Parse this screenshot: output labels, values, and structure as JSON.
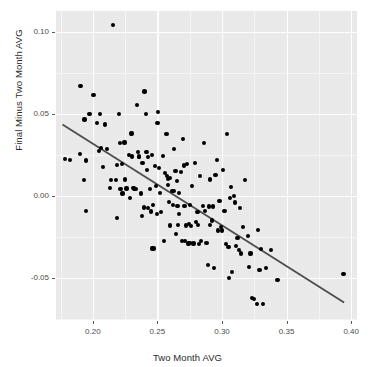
{
  "chart_data": {
    "type": "scatter",
    "title": "",
    "xlabel": "Two Month AVG",
    "ylabel": "Final Minus Two Month AVG",
    "xlim": [
      0.1715,
      0.4045
    ],
    "ylim": [
      -0.0755,
      0.1125
    ],
    "xticks": [
      0.2,
      0.25,
      0.3,
      0.35,
      0.4
    ],
    "xtick_labels": [
      "0.20",
      "0.25",
      "0.30",
      "0.35",
      "0.40"
    ],
    "yticks": [
      -0.05,
      0.0,
      0.05,
      0.1
    ],
    "ytick_labels": [
      "-0.05",
      "0.00",
      "0.05",
      "0.10"
    ],
    "x_minor_ticks": [
      0.175,
      0.225,
      0.275,
      0.325,
      0.375
    ],
    "y_minor_ticks": [
      -0.075,
      -0.025,
      0.025,
      0.075
    ],
    "grid": true,
    "legend": "none",
    "panel_background": "#ebebeb",
    "grid_major_color": "#ffffff",
    "grid_minor_color": "#f6f6f6",
    "point_color": "#000000",
    "point_size": 4.2,
    "fit_line": {
      "type": "linear",
      "color": "#4d4d4d",
      "width": 1.8,
      "x_start": 0.1765,
      "y_start": 0.0435,
      "x_end": 0.3945,
      "y_end": -0.0648
    },
    "points": [
      [
        0.1785,
        0.0225
      ],
      [
        0.1825,
        0.022
      ],
      [
        0.19,
        0.0255
      ],
      [
        0.1905,
        0.067
      ],
      [
        0.193,
        0.0095
      ],
      [
        0.1935,
        0.0465
      ],
      [
        0.1945,
        0.0215
      ],
      [
        0.195,
        -0.009
      ],
      [
        0.1975,
        0.05
      ],
      [
        0.2005,
        0.0615
      ],
      [
        0.203,
        0.0445
      ],
      [
        0.2045,
        0.0275
      ],
      [
        0.2055,
        0.05
      ],
      [
        0.2065,
        0.029
      ],
      [
        0.208,
        0.0175
      ],
      [
        0.2095,
        0.0435
      ],
      [
        0.211,
        0.0285
      ],
      [
        0.213,
        0.005
      ],
      [
        0.214,
        0.0095
      ],
      [
        0.2155,
        0.104
      ],
      [
        0.218,
        0.0095
      ],
      [
        0.2185,
        0.019
      ],
      [
        0.219,
        -0.0135
      ],
      [
        0.22,
        0.05
      ],
      [
        0.221,
        0.032
      ],
      [
        0.2215,
        0.004
      ],
      [
        0.2225,
        0.0195
      ],
      [
        0.223,
        0.0015
      ],
      [
        0.2245,
        0.0325
      ],
      [
        0.225,
        0.01
      ],
      [
        0.226,
        0.0045
      ],
      [
        0.228,
        0.025
      ],
      [
        0.2285,
        -0.0015
      ],
      [
        0.23,
        0.038
      ],
      [
        0.2305,
        0.024
      ],
      [
        0.231,
        0.005
      ],
      [
        0.232,
        0.0045
      ],
      [
        0.233,
        0.004
      ],
      [
        0.2345,
        0.0555
      ],
      [
        0.235,
        0.0265
      ],
      [
        0.2355,
        0.024
      ],
      [
        0.236,
        0.0235
      ],
      [
        0.237,
        0.0015
      ],
      [
        0.238,
        -0.012
      ],
      [
        0.2385,
        0.02
      ],
      [
        0.2395,
        -0.007
      ],
      [
        0.24,
        0.0635
      ],
      [
        0.241,
        0.05
      ],
      [
        0.2415,
        0.0265
      ],
      [
        0.242,
        0.016
      ],
      [
        0.2425,
        -0.0075
      ],
      [
        0.243,
        0.0235
      ],
      [
        0.244,
        0.004
      ],
      [
        0.245,
        -0.0095
      ],
      [
        0.2455,
        -0.032
      ],
      [
        0.246,
        0.025
      ],
      [
        0.2465,
        -0.0055
      ],
      [
        0.247,
        -0.032
      ],
      [
        0.248,
        0.018
      ],
      [
        0.249,
        0.006
      ],
      [
        0.2495,
        -0.011
      ],
      [
        0.25,
        0.0445
      ],
      [
        0.2505,
        0.051
      ],
      [
        0.251,
        0.017
      ],
      [
        0.252,
        0.002
      ],
      [
        0.253,
        -0.01
      ],
      [
        0.2545,
        0.0245
      ],
      [
        0.255,
        -0.0275
      ],
      [
        0.256,
        0.014
      ],
      [
        0.257,
        0.0375
      ],
      [
        0.2575,
        0.012
      ],
      [
        0.258,
        0.0105
      ],
      [
        0.2585,
        0.0065
      ],
      [
        0.259,
        -0.0035
      ],
      [
        0.2595,
        -0.018
      ],
      [
        0.26,
        0.011
      ],
      [
        0.261,
        0.003
      ],
      [
        0.262,
        -0.0055
      ],
      [
        0.2625,
        0.003
      ],
      [
        0.263,
        0.0285
      ],
      [
        0.264,
        0.015
      ],
      [
        0.2645,
        -0.023
      ],
      [
        0.265,
        0.009
      ],
      [
        0.2655,
        -0.006
      ],
      [
        0.266,
        -0.0175
      ],
      [
        0.2665,
        0.002
      ],
      [
        0.267,
        -0.011
      ],
      [
        0.268,
        0.0145
      ],
      [
        0.269,
        -0.0275
      ],
      [
        0.27,
        0.0345
      ],
      [
        0.2705,
        0.0185
      ],
      [
        0.271,
        -0.006
      ],
      [
        0.2715,
        -0.0275
      ],
      [
        0.272,
        -0.018
      ],
      [
        0.273,
        0.0195
      ],
      [
        0.274,
        -0.029
      ],
      [
        0.2745,
        -0.017
      ],
      [
        0.275,
        -0.0055
      ],
      [
        0.2755,
        -0.0285
      ],
      [
        0.276,
        -0.0185
      ],
      [
        0.277,
        0.006
      ],
      [
        0.278,
        -0.029
      ],
      [
        0.279,
        0.02
      ],
      [
        0.28,
        -0.016
      ],
      [
        0.281,
        -0.01
      ],
      [
        0.2815,
        -0.0175
      ],
      [
        0.282,
        -0.0295
      ],
      [
        0.283,
        0.012
      ],
      [
        0.284,
        -0.0275
      ],
      [
        0.285,
        -0.006
      ],
      [
        0.286,
        0.032
      ],
      [
        0.287,
        -0.009
      ],
      [
        0.288,
        -0.0285
      ],
      [
        0.289,
        -0.042
      ],
      [
        0.29,
        -0.0065
      ],
      [
        0.2905,
        -0.0175
      ],
      [
        0.291,
        0.01
      ],
      [
        0.292,
        -0.015
      ],
      [
        0.293,
        -0.0065
      ],
      [
        0.294,
        -0.044
      ],
      [
        0.295,
        0.0125
      ],
      [
        0.296,
        0.022
      ],
      [
        0.297,
        -0.021
      ],
      [
        0.298,
        -0.003
      ],
      [
        0.299,
        -0.019
      ],
      [
        0.3,
        -0.021
      ],
      [
        0.301,
        0.016
      ],
      [
        0.302,
        -0.009
      ],
      [
        0.303,
        -0.0295
      ],
      [
        0.304,
        0.0375
      ],
      [
        0.305,
        -0.031
      ],
      [
        0.3055,
        -0.05
      ],
      [
        0.306,
        -0.0015
      ],
      [
        0.307,
        0.0055
      ],
      [
        0.308,
        -0.0465
      ],
      [
        0.309,
        0.0
      ],
      [
        0.31,
        -0.004
      ],
      [
        0.311,
        -0.0305
      ],
      [
        0.312,
        -0.0255
      ],
      [
        0.313,
        -0.033
      ],
      [
        0.314,
        -0.0075
      ],
      [
        0.315,
        -0.035
      ],
      [
        0.316,
        -0.019
      ],
      [
        0.318,
        0.0095
      ],
      [
        0.32,
        -0.0245
      ],
      [
        0.321,
        -0.0435
      ],
      [
        0.322,
        -0.035
      ],
      [
        0.323,
        -0.062
      ],
      [
        0.325,
        -0.0625
      ],
      [
        0.327,
        -0.066
      ],
      [
        0.328,
        -0.0205
      ],
      [
        0.329,
        -0.045
      ],
      [
        0.33,
        -0.0325
      ],
      [
        0.332,
        -0.066
      ],
      [
        0.334,
        -0.044
      ],
      [
        0.338,
        -0.033
      ],
      [
        0.343,
        -0.051
      ],
      [
        0.394,
        -0.0475
      ]
    ]
  }
}
